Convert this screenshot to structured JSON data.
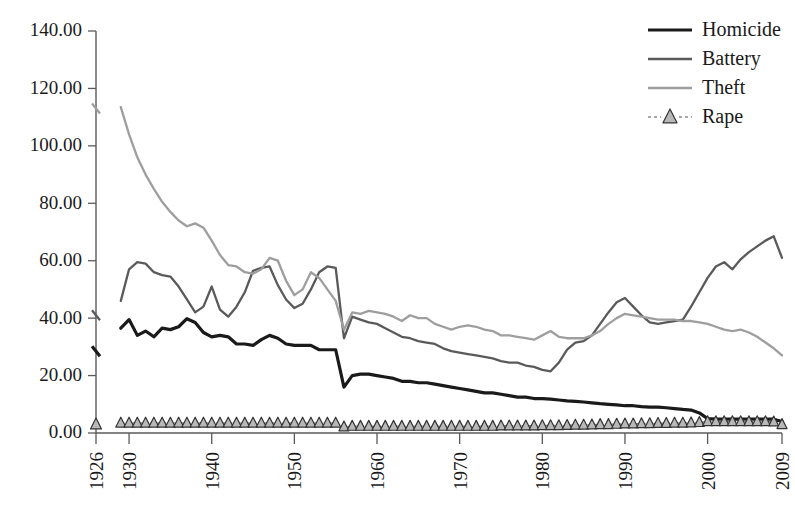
{
  "chart_data": {
    "type": "line",
    "title": "",
    "xlabel": "",
    "ylabel": "",
    "ylim": [
      0,
      140
    ],
    "yticks": [
      0,
      20,
      40,
      60,
      80,
      100,
      120,
      140
    ],
    "ytick_labels": [
      "0.00",
      "20.00",
      "40.00",
      "60.00",
      "80.00",
      "100.00",
      "120.00",
      "140.00"
    ],
    "xlim": [
      1926,
      2009
    ],
    "xticks": [
      1926,
      1930,
      1940,
      1950,
      1960,
      1970,
      1980,
      1990,
      2000,
      2009
    ],
    "xtick_labels": [
      "1926",
      "1930",
      "1940",
      "1950",
      "1960",
      "1970",
      "1980",
      "1990",
      "2000",
      "2009"
    ],
    "grid": false,
    "legend_position": "top-right",
    "x": [
      1926,
      1929,
      1930,
      1931,
      1932,
      1933,
      1934,
      1935,
      1936,
      1937,
      1938,
      1939,
      1940,
      1941,
      1942,
      1943,
      1944,
      1945,
      1946,
      1947,
      1948,
      1949,
      1950,
      1951,
      1952,
      1953,
      1954,
      1955,
      1956,
      1957,
      1958,
      1959,
      1960,
      1961,
      1962,
      1963,
      1964,
      1965,
      1966,
      1967,
      1968,
      1969,
      1970,
      1971,
      1972,
      1973,
      1974,
      1975,
      1976,
      1977,
      1978,
      1979,
      1980,
      1981,
      1982,
      1983,
      1984,
      1985,
      1986,
      1987,
      1988,
      1989,
      1990,
      1991,
      1992,
      1993,
      1994,
      1995,
      1996,
      1997,
      1998,
      1999,
      2000,
      2001,
      2002,
      2003,
      2004,
      2005,
      2006,
      2007,
      2008,
      2009
    ],
    "series": [
      {
        "name": "Homicide",
        "color": "#1a1a1a",
        "width": 3.2,
        "dash": "none",
        "marker": "none",
        "gap_after_x": 1926,
        "values": [
          28.5,
          36.5,
          39.5,
          34.0,
          35.5,
          33.5,
          36.5,
          36.0,
          37.0,
          39.8,
          38.5,
          35.0,
          33.5,
          34.0,
          33.5,
          31.0,
          31.0,
          30.5,
          32.5,
          34.0,
          33.0,
          31.0,
          30.5,
          30.5,
          30.5,
          29.0,
          29.0,
          29.0,
          16.0,
          20.0,
          20.5,
          20.5,
          20.0,
          19.5,
          19.0,
          18.0,
          18.0,
          17.5,
          17.5,
          17.0,
          16.5,
          16.0,
          15.5,
          15.0,
          14.5,
          14.0,
          14.0,
          13.5,
          13.0,
          12.5,
          12.5,
          12.0,
          12.0,
          11.8,
          11.5,
          11.2,
          11.0,
          10.8,
          10.5,
          10.2,
          10.0,
          9.8,
          9.5,
          9.5,
          9.2,
          9.0,
          9.0,
          8.8,
          8.5,
          8.2,
          8.0,
          7.0,
          5.0,
          4.8,
          4.8,
          4.8,
          4.8,
          4.8,
          4.8,
          4.8,
          4.8,
          4.0
        ]
      },
      {
        "name": "Battery",
        "color": "#5a5a5a",
        "width": 2.3,
        "dash": "none",
        "marker": "none",
        "gap_after_x": 1926,
        "values": [
          41.0,
          46.0,
          57.0,
          59.5,
          59.0,
          56.0,
          55.0,
          54.5,
          51.0,
          46.5,
          42.0,
          44.0,
          51.0,
          43.0,
          40.5,
          44.0,
          49.0,
          56.5,
          57.5,
          58.0,
          51.5,
          46.5,
          43.5,
          45.0,
          50.0,
          56.0,
          58.0,
          57.5,
          33.0,
          40.5,
          39.5,
          38.5,
          38.0,
          36.5,
          35.0,
          33.5,
          33.0,
          32.0,
          31.5,
          31.0,
          29.5,
          28.5,
          28.0,
          27.5,
          27.0,
          26.5,
          26.0,
          25.0,
          24.5,
          24.5,
          23.5,
          23.0,
          22.0,
          21.5,
          24.5,
          29.0,
          31.5,
          32.0,
          34.0,
          38.0,
          42.0,
          45.5,
          47.0,
          44.0,
          41.0,
          38.5,
          38.0,
          38.5,
          39.0,
          39.5,
          44.0,
          49.0,
          54.0,
          58.0,
          59.5,
          57.0,
          60.5,
          63.0,
          65.0,
          67.0,
          68.5,
          61.0
        ]
      },
      {
        "name": "Theft",
        "color": "#9e9e9e",
        "width": 2.3,
        "dash": "none",
        "marker": "none",
        "gap_after_x": 1926,
        "values": [
          113.0,
          113.5,
          104.0,
          96.0,
          90.0,
          85.0,
          80.5,
          77.0,
          74.0,
          72.0,
          73.0,
          71.5,
          67.0,
          62.0,
          58.5,
          58.0,
          56.0,
          55.5,
          57.0,
          61.0,
          60.0,
          53.0,
          48.0,
          50.0,
          56.0,
          54.0,
          50.0,
          46.0,
          36.0,
          42.0,
          41.5,
          42.5,
          42.0,
          41.5,
          40.5,
          39.0,
          41.0,
          40.0,
          40.0,
          38.0,
          37.0,
          36.0,
          37.0,
          37.5,
          37.0,
          36.0,
          35.5,
          34.0,
          34.0,
          33.5,
          33.0,
          32.5,
          34.0,
          35.5,
          33.5,
          33.0,
          33.0,
          33.0,
          34.0,
          35.5,
          38.0,
          40.0,
          41.5,
          41.0,
          40.5,
          40.0,
          39.5,
          39.5,
          39.5,
          39.0,
          39.0,
          38.5,
          38.0,
          37.0,
          36.0,
          35.5,
          36.0,
          35.0,
          33.5,
          31.5,
          29.5,
          27.0
        ]
      },
      {
        "name": "Rape",
        "color": "#8a8a8a",
        "width": 1.4,
        "dash": "3 3",
        "marker": "triangle",
        "marker_fill": "#b8b8b8",
        "marker_stroke": "#333333",
        "gap_after_x": 1926,
        "values": [
          3.0,
          3.5,
          3.5,
          3.5,
          3.5,
          3.5,
          3.5,
          3.5,
          3.5,
          3.5,
          3.5,
          3.5,
          3.5,
          3.5,
          3.5,
          3.5,
          3.5,
          3.5,
          3.5,
          3.5,
          3.5,
          3.5,
          3.5,
          3.5,
          3.5,
          3.5,
          3.5,
          3.5,
          2.2,
          2.4,
          2.4,
          2.4,
          2.4,
          2.4,
          2.4,
          2.4,
          2.4,
          2.4,
          2.4,
          2.4,
          2.4,
          2.4,
          2.4,
          2.4,
          2.4,
          2.4,
          2.4,
          2.5,
          2.5,
          2.5,
          2.5,
          2.5,
          2.6,
          2.6,
          2.6,
          2.7,
          2.8,
          2.8,
          2.9,
          3.0,
          3.0,
          3.1,
          3.2,
          3.2,
          3.3,
          3.3,
          3.4,
          3.4,
          3.5,
          3.5,
          3.6,
          3.7,
          4.0,
          4.0,
          4.0,
          4.0,
          4.0,
          4.0,
          4.0,
          4.0,
          3.9,
          3.0
        ]
      }
    ]
  },
  "legend": {
    "entries": [
      {
        "label": "Homicide"
      },
      {
        "label": "Battery"
      },
      {
        "label": "Theft"
      },
      {
        "label": "Rape"
      }
    ]
  }
}
